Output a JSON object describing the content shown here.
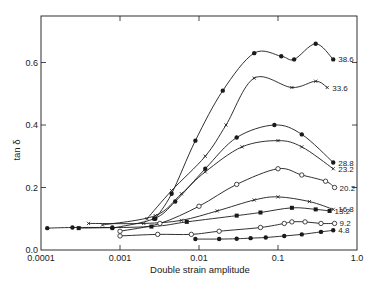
{
  "chart_data": {
    "type": "line",
    "title": "",
    "xlabel": "Double strain amplitude",
    "ylabel": "tan δ",
    "xscale": "log",
    "xlim": [
      0.0001,
      1.0
    ],
    "ylim": [
      0.0,
      0.7
    ],
    "xticks": [
      0.0001,
      0.001,
      0.01,
      0.1,
      1.0
    ],
    "xtick_labels": [
      "0.0001",
      "0.001",
      "0.01",
      "0.1",
      "1.0"
    ],
    "yticks": [
      0.0,
      0.2,
      0.4,
      0.6
    ],
    "ytick_labels": [
      "0.0",
      "0.2",
      "0.4",
      "0.6"
    ],
    "grid": false,
    "legend": "inline labels at right end of each curve",
    "series": [
      {
        "name": "38.6",
        "marker": "filled-circle",
        "x": [
          0.0028,
          0.0045,
          0.009,
          0.02,
          0.05,
          0.11,
          0.16,
          0.3,
          0.5
        ],
        "y": [
          0.1,
          0.18,
          0.35,
          0.51,
          0.63,
          0.62,
          0.61,
          0.66,
          0.61
        ]
      },
      {
        "name": "33.6",
        "marker": "cross",
        "x": [
          0.0022,
          0.0045,
          0.012,
          0.022,
          0.05,
          0.15,
          0.3,
          0.42
        ],
        "y": [
          0.1,
          0.19,
          0.3,
          0.4,
          0.55,
          0.52,
          0.54,
          0.52
        ]
      },
      {
        "name": "28.8",
        "marker": "filled-circle",
        "x": [
          0.0008,
          0.0027,
          0.005,
          0.012,
          0.03,
          0.09,
          0.2,
          0.5
        ],
        "y": [
          0.07,
          0.1,
          0.155,
          0.26,
          0.36,
          0.4,
          0.37,
          0.28
        ]
      },
      {
        "name": "23.2",
        "marker": "cross",
        "x": [
          0.0006,
          0.0028,
          0.006,
          0.012,
          0.035,
          0.1,
          0.2,
          0.5
        ],
        "y": [
          0.08,
          0.11,
          0.18,
          0.25,
          0.33,
          0.35,
          0.33,
          0.26
        ]
      },
      {
        "name": "20.2",
        "marker": "open-circle",
        "x": [
          0.001,
          0.0032,
          0.01,
          0.03,
          0.1,
          0.2,
          0.4,
          0.52
        ],
        "y": [
          0.06,
          0.085,
          0.14,
          0.21,
          0.26,
          0.24,
          0.22,
          0.2
        ]
      },
      {
        "name": "16.8",
        "marker": "cross",
        "x": [
          0.0004,
          0.002,
          0.006,
          0.017,
          0.05,
          0.1,
          0.25,
          0.5
        ],
        "y": [
          0.085,
          0.085,
          0.095,
          0.125,
          0.16,
          0.17,
          0.155,
          0.13
        ]
      },
      {
        "name": "13.2",
        "marker": "filled-square",
        "x": [
          0.0003,
          0.0025,
          0.007,
          0.03,
          0.06,
          0.15,
          0.3,
          0.45
        ],
        "y": [
          0.07,
          0.075,
          0.09,
          0.11,
          0.12,
          0.135,
          0.13,
          0.125
        ]
      },
      {
        "name": "9.2",
        "marker": "open-circle",
        "x": [
          0.001,
          0.003,
          0.008,
          0.018,
          0.06,
          0.12,
          0.15,
          0.22,
          0.35,
          0.52
        ],
        "y": [
          0.045,
          0.05,
          0.05,
          0.06,
          0.072,
          0.085,
          0.09,
          0.09,
          0.085,
          0.085
        ]
      },
      {
        "name": "4.8",
        "marker": "filled-circle",
        "x": [
          0.009,
          0.018,
          0.03,
          0.045,
          0.07,
          0.12,
          0.2,
          0.35,
          0.5
        ],
        "y": [
          0.035,
          0.035,
          0.036,
          0.038,
          0.04,
          0.045,
          0.05,
          0.058,
          0.063
        ]
      },
      {
        "name": "",
        "marker": "filled-circle",
        "note": "low-amplitude reference points",
        "x": [
          0.00012,
          0.00025,
          0.0008
        ],
        "y": [
          0.07,
          0.072,
          0.072
        ]
      }
    ]
  },
  "plot_layout": {
    "left_px": 41,
    "right_px": 357,
    "top_px": 16,
    "bottom_px": 250,
    "line_color": "#1a1a1a"
  }
}
